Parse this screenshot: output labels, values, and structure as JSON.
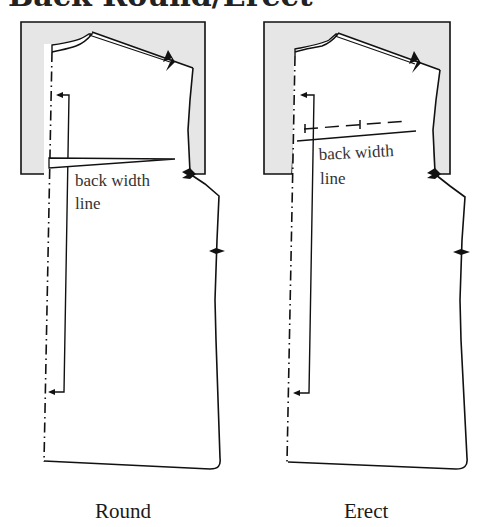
{
  "title": "Back Round/Erect",
  "panels": [
    {
      "id": "round",
      "caption": "Round",
      "annotation_line1": "back width",
      "annotation_line2": "line",
      "adjustment": "wedge opened along back width line"
    },
    {
      "id": "erect",
      "caption": "Erect",
      "annotation_line1": "back width",
      "annotation_line2": "line",
      "adjustment": "dashed line overlapped above back width line"
    }
  ],
  "colors": {
    "shaded_area": "#e6e6e6",
    "line": "#111111",
    "background": "#ffffff"
  }
}
